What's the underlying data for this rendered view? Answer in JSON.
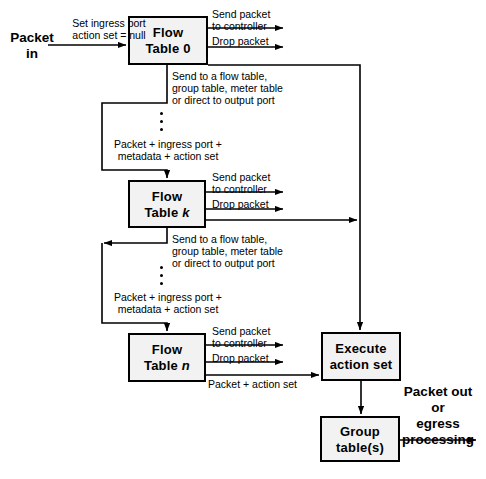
{
  "diagram": {
    "colors": {
      "line": "#000000",
      "box_fill": "#f2f2f2",
      "box_border": "#000000",
      "text": "#000000"
    }
  },
  "boxes": {
    "flow_table_0": {
      "line1": "Flow",
      "line2": "Table 0"
    },
    "flow_table_k": {
      "line1": "Flow",
      "line2": "Table k"
    },
    "flow_table_n": {
      "line1": "Flow",
      "line2": "Table n"
    },
    "execute_action_set": {
      "line1": "Execute",
      "line2": "action set"
    },
    "group_tables": {
      "line1": "Group",
      "line2": "table(s)"
    }
  },
  "labels": {
    "packet_in": "Packet\nin",
    "ingress_action": "Set ingress port\naction set = null",
    "send_packet_controller_0": "Send packet\nto controller",
    "drop_packet_0": "Drop packet",
    "send_to_flow_table_0": "Send to a flow table,\ngroup table, meter table\nor direct to output port",
    "packet_metadata_0": "Packet + ingress port +\nmetadata + action set",
    "send_packet_controller_k": "Send packet\nto controller",
    "drop_packet_k": "Drop packet",
    "send_to_flow_table_k": "Send to a flow table,\ngroup table, meter table\nor direct to output port",
    "packet_metadata_k": "Packet + ingress port +\nmetadata + action set",
    "send_packet_controller_n": "Send packet\nto controller",
    "drop_packet_n": "Drop packet",
    "packet_action_set_n": "Packet + action set",
    "packet_out": "Packet out\nor\negress\nprocessing"
  }
}
